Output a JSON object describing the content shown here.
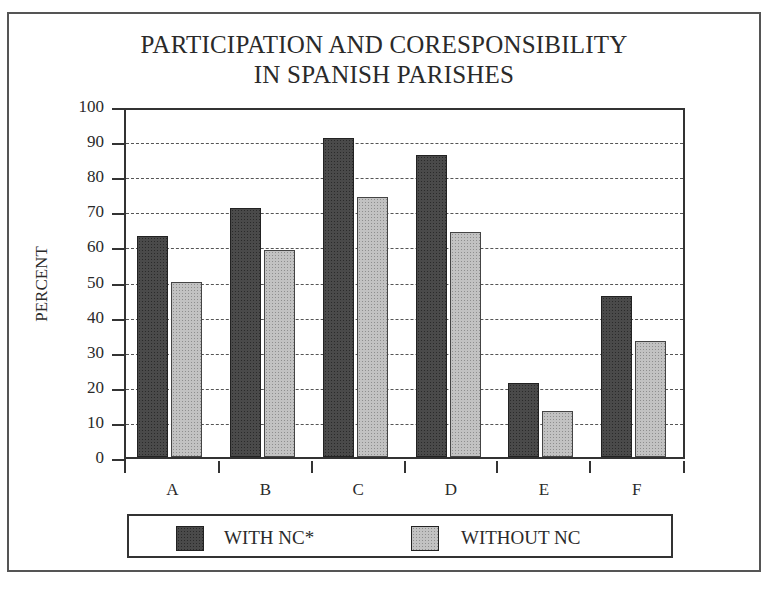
{
  "chart_data": {
    "type": "bar",
    "title": "PARTICIPATION AND CORESPONSIBILITY IN SPANISH PARISHES",
    "title_lines": [
      "PARTICIPATION AND CORESPONSIBILITY",
      "IN SPANISH PARISHES"
    ],
    "xlabel": "",
    "ylabel": "PERCENT",
    "ylim": [
      0,
      100
    ],
    "yticks": [
      0,
      10,
      20,
      30,
      40,
      50,
      60,
      70,
      80,
      90,
      100
    ],
    "grid": "horizontal dashed",
    "legend_position": "bottom",
    "categories": [
      "A",
      "B",
      "C",
      "D",
      "E",
      "F"
    ],
    "series": [
      {
        "name": "WITH NC*",
        "color": "#4a4a4a",
        "values": [
          63,
          71,
          91,
          86,
          21,
          46
        ]
      },
      {
        "name": "WITHOUT NC",
        "color": "#c2c2c2",
        "values": [
          50,
          59,
          74,
          64,
          13,
          33
        ]
      }
    ]
  }
}
